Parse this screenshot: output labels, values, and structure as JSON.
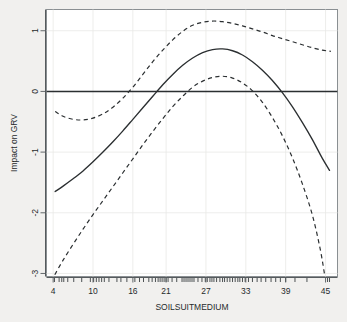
{
  "chart_data": {
    "type": "line",
    "title": "",
    "subtitle": "",
    "xlabel": "SOILSUITMEDIUM",
    "ylabel": "Impact on GRV",
    "xlim": [
      3.0,
      46.8
    ],
    "ylim": [
      -3.05,
      1.35
    ],
    "grid": true,
    "legend": null,
    "x_ticks": [
      4,
      10,
      16,
      21,
      27,
      33,
      39,
      45
    ],
    "x_tick_labels": [
      "4",
      "10",
      "16",
      "21",
      "27",
      "33",
      "39",
      "45"
    ],
    "y_ticks": [
      1,
      0,
      -1,
      -2,
      -3
    ],
    "y_tick_labels": [
      "1",
      "0",
      "-1",
      "-2",
      "-3"
    ],
    "reference_lines": [
      {
        "name": "zero-line",
        "orientation": "horizontal",
        "value": 0
      }
    ],
    "series": [
      {
        "name": "smooth-fit",
        "style": "solid",
        "color": "#2b2f31",
        "x": [
          4.3,
          5.5,
          7.0,
          8.5,
          10.0,
          11.5,
          13.0,
          14.5,
          16.0,
          17.5,
          19.0,
          20.5,
          22.0,
          23.5,
          25.0,
          26.5,
          28.0,
          29.5,
          31.0,
          32.5,
          34.0,
          35.5,
          37.0,
          38.5,
          40.0,
          41.5,
          43.0,
          44.5,
          45.6
        ],
        "values": [
          -1.65,
          -1.56,
          -1.44,
          -1.31,
          -1.16,
          -1.0,
          -0.83,
          -0.65,
          -0.46,
          -0.27,
          -0.08,
          0.11,
          0.28,
          0.43,
          0.55,
          0.64,
          0.69,
          0.7,
          0.67,
          0.6,
          0.49,
          0.35,
          0.18,
          -0.02,
          -0.25,
          -0.51,
          -0.79,
          -1.1,
          -1.3
        ]
      },
      {
        "name": "upper-confidence-band",
        "style": "dashed",
        "color": "#2b2f31",
        "x": [
          4.3,
          5.5,
          7.0,
          8.5,
          10.0,
          11.5,
          13.0,
          14.5,
          16.0,
          17.5,
          19.0,
          20.5,
          22.0,
          23.5,
          25.0,
          26.5,
          28.0,
          29.5,
          31.0,
          32.5,
          34.0,
          35.5,
          37.0,
          38.5,
          40.0,
          41.5,
          43.0,
          44.5,
          45.8
        ],
        "values": [
          -0.33,
          -0.41,
          -0.46,
          -0.47,
          -0.44,
          -0.37,
          -0.26,
          -0.11,
          0.07,
          0.28,
          0.49,
          0.68,
          0.85,
          0.99,
          1.09,
          1.14,
          1.16,
          1.15,
          1.12,
          1.08,
          1.03,
          0.98,
          0.92,
          0.87,
          0.82,
          0.77,
          0.72,
          0.68,
          0.66
        ]
      },
      {
        "name": "lower-confidence-band",
        "style": "dashed",
        "color": "#2b2f31",
        "x": [
          4.25,
          5.5,
          7.0,
          8.5,
          10.0,
          11.5,
          13.0,
          14.5,
          16.0,
          17.5,
          19.0,
          20.5,
          22.0,
          23.5,
          25.0,
          26.5,
          28.0,
          29.5,
          31.0,
          32.5,
          34.0,
          35.5,
          37.0,
          38.5,
          40.0,
          41.5,
          43.0,
          44.2,
          44.9
        ],
        "values": [
          -3.02,
          -2.78,
          -2.52,
          -2.27,
          -2.03,
          -1.8,
          -1.57,
          -1.34,
          -1.11,
          -0.88,
          -0.66,
          -0.45,
          -0.25,
          -0.08,
          0.07,
          0.17,
          0.23,
          0.25,
          0.22,
          0.14,
          0.01,
          -0.18,
          -0.43,
          -0.73,
          -1.09,
          -1.52,
          -2.03,
          -2.6,
          -3.05
        ]
      }
    ],
    "rug_marks": [
      4.2,
      4.9,
      5.3,
      5.6,
      6.2,
      7.1,
      8.3,
      9.6,
      10.1,
      10.5,
      10.9,
      11.3,
      11.7,
      12.4,
      13.6,
      14.2,
      15.1,
      16.3,
      17.0,
      17.6,
      18.4,
      18.9,
      19.4,
      19.8,
      20.1,
      20.4,
      20.7,
      21.0,
      21.3,
      21.9,
      22.6,
      23.4,
      23.7,
      24.0,
      24.3,
      24.6,
      24.9,
      25.2,
      25.8,
      26.4,
      26.9,
      27.2,
      27.6,
      27.9,
      28.2,
      28.6,
      29.1,
      29.5,
      29.8,
      30.2,
      30.6,
      31.0,
      31.4,
      31.8,
      32.1,
      32.5,
      32.9,
      33.4,
      34.0,
      34.7,
      35.3,
      36.0,
      36.8,
      37.5,
      38.2,
      39.0,
      40.4,
      42.2,
      45.3,
      45.6
    ]
  }
}
